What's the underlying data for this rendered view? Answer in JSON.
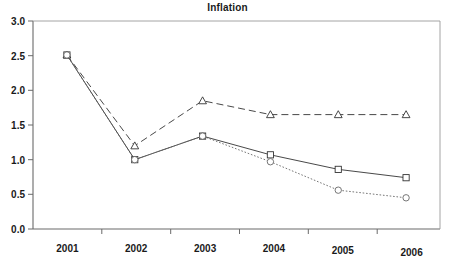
{
  "chart_data": {
    "type": "line",
    "title": "Inflation",
    "xlabel": "",
    "ylabel": "",
    "categories": [
      "2001",
      "2002",
      "2003",
      "2004",
      "2005",
      "2006"
    ],
    "x_tick_labels": [
      "2001",
      "2002",
      "2003",
      "2004",
      "2005",
      "2006"
    ],
    "y_tick_labels": [
      "0.0",
      "0.5",
      "1.0",
      "1.5",
      "2.0",
      "2.5",
      "3.0"
    ],
    "y_ticks": [
      0.0,
      0.5,
      1.0,
      1.5,
      2.0,
      2.5,
      3.0
    ],
    "ylim": [
      0.0,
      3.0
    ],
    "grid": false,
    "legend": "none",
    "series": [
      {
        "name": "dashed-triangle-series",
        "marker": "triangle",
        "line_style": "dashed",
        "color": "#333333",
        "values": [
          2.51,
          1.2,
          1.85,
          1.65,
          1.65,
          1.65
        ]
      },
      {
        "name": "solid-square-series",
        "marker": "square",
        "line_style": "solid",
        "color": "#333333",
        "values": [
          2.51,
          1.0,
          1.34,
          1.07,
          0.86,
          0.74
        ]
      },
      {
        "name": "dotted-circle-series",
        "marker": "circle",
        "line_style": "dotted",
        "color": "#666666",
        "values": [
          2.51,
          1.0,
          1.34,
          0.97,
          0.56,
          0.45
        ]
      }
    ]
  },
  "colors": {
    "axis": "#555555",
    "border": "#888888",
    "text": "#1a1a1a",
    "background": "#ffffff"
  }
}
